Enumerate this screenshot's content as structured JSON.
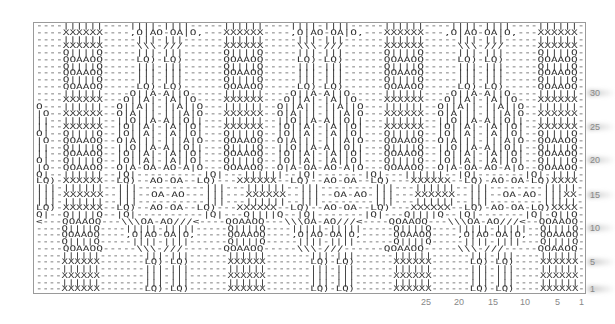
{
  "chart": {
    "columns": 84,
    "rows_count": 40,
    "grid_color": "#9a9a9a",
    "symbol_color": "#333333",
    "rows": [
      "----||||||----||||-||||-----||||||----||||-||||-----||||||----||||-||||----||||||-",
      "----XXXXXX----,O|AO-OA|O,---XXXXXX----,O|AO-OA|O,---XXXXXX---,O|AO-OA|O,---XXXXXX-",
      "----||||||-----|||-|||------||||||-----|||-|||------||||||-----|||-|||-----||||||-",
      "----XXXXXX-----\\\\\\-///------XXXXXX-----\\\\\\-///------XXXXXX-----\\\\\\-///-----XXXXXX-",
      "----Q||||Q-----|||-|||------Q||||Q-----|||-|||------Q||||Q-----|||-|||-----Q||||Q-",
      "----QOAAOQ-----LQ)-LQ)------QOAAOQ-----LQ)-LQ)------QOAAOQ-----LQ)-LQ)-----QOAAOQ-",
      "----Q||||Q-----|||-|||------Q||||Q-----|||-|||------Q||||Q-----|||-|||-----Q||||Q-",
      "----QOAAOQ-----|||-|||------QOAAOQ-----|||-|||------QOAAOQ-----|||-|||-----QOAAOQ-",
      "----Q||||Q-----|||-|||------Q||||Q-----|||-|||------Q||||Q-----|||-|||-----Q||||Q-",
      "----QOAAOQ-----LQ)-LQ)------QOAAOQ-----LQ)-LQ)------QOAAOQ-----LQ)-LQ)-----QOAAOQ-",
      "----||||||----O||A-A||O-----||||||----O||A-A||O-----||||||----O||A-A||O----||||||-",
      "----XXXXXX---O||A|-|A||O----XXXXXX---O||A|-|A||O----XXXXXX---O||A|-|A||O---XXXXXX-",
      "O---||||||--O||A||-||A||O---||||||--O||A||-||A||O---||||||--O||A||-||A||O--||||||-",
      "|O--XXXXXX--O|A|||-|||A|O---XXXXXX--O|A|||-|||A|O---XXXXXX--O|A|||-|||A|O--XXXXXX-",
      "||--||||||--||O||A-A||O||---||||||--||O||A-A||O||---||||||--||O||A-A||O||--||||||-",
      "||--XXXXXX--|O||A|-|A||O|---XXXXXX--|O||A|-|A||O|---XXXXXX--|O||A|-|A||O|--XXXXXX-",
      "O|--Q||||Q--|O||A|-|A||O|---Q||||Q--|O||A|-|A||O|---Q||||Q--|O||A|-|A||O|--Q||||Q-",
      "|O--QOAAOQ--O|A|||-|||A|O---QOAAOQ--O|A|||-|||A|O---QOAAOQ--O|A|||-|||A|O--QOAAOQ-",
      "||--Q||||Q--||O||A-A||O||---Q||||Q--||O||A-A||O||---Q||||Q--||O||A-A||O||--Q||||Q-",
      "||--QOAAOQ--|O||A|-|A||O|---QOAAOQ--|O||A|-|A||O|---QOAAOQ--|O||A|-|A||O|--QOAAOQ-",
      "O|--Q||||Q--|O||A|-|A||O|---Q||||Q--|O||A|-|A||O|---Q||||Q--|O||A|-|A||O|--Q||||Q-",
      "|O--QOAAOQ--O|A-OA-AO-A|O---QOAAOQ--O|A-OA-AO-A|O---QOAAOQ--O|A-OA-AO-A|O--QOAAOQ-",
      "Q|--||||||--|Q|----------|Q|---||||||--|Q|-------|Q|---||||||--|Q|-------|Q|-||||-",
      "LQ)-XXXXXX--LQ)--AO-OA--LQ)---XXXXXX--LQ)--AO-OA--LQ)---XXXXXX--LQ)-AO-OA-LQ)XXXX-",
      "|||-||||||--|||----------|||---||||||--|||--------|||---||||||--|||--------|||||-",
      "|||-XXXXXX--|||--OA-AO---|||---XXXXXX--|||--OA-AO-|||---XXXXXX--|||--OA-AO-|||XX-",
      "|||-||||||--|||----------|||---||||||--|||--------|||---||||||--|||--------|||||-",
      "LQ)-XXXXXX--LQ)--AO-OA--LQ)---XXXXXX--LQ)--AO-OA--LQ)---XXXXXX--LQ)-AO-OA-LQ)XXXX-",
      "Q|--Q||||Q--|Q|----------|Q|---Q||||Q--|Q|-------|Q|---Q||||Q--|Q|-------|Q|-Q||Q-",
      "<---QOAAOQ---\\\\\\OA-AO///<----QOAAOQ---\\\\\\OA-AO///<----QOAAOQ---\\\\\\OA-AO///<--QOAAOQ-",
      "----Q||||Q----|||||-|||||-----Q||||Q----|||||-|||||-----Q||||Q----|||||-|||||--Q||||Q-",
      "----QOAAOQ----,O|AO-OA|O,-----QOAAOQ----,O|AO-OA|O,-----QOAAOQ----,O|AO-OA|O,--QOAAOQ-",
      "----Q||||Q-----||||-||||------Q||||Q-----||||-||||------Q||||Q-----||||-||||---Q||||Q-",
      "----QOAAOQ-----\\\\\\-///------QOAAOQ-----\\\\\\-///------QOAAOQ-----\\\\\\-///-----QOAAOQ-",
      "----||||||-------|||-|||------||||||-------|||-|||------||||||------|||-|||----||||||-",
      "----XXXXXX-------LQ)-LQ)------XXXXXX-------LQ)-LQ)------XXXXXX------LQ)-LQ)----XXXXXX-",
      "----||||||-------|||-|||------||||||-------|||-|||------||||||------|||-|||----||||||-",
      "----XXXXXX-------|||-|||------XXXXXX-------|||-|||------XXXXXX------|||-|||----XXXXXX-",
      "----||||||-------|||-|||------||||||-------|||-|||------||||||------|||-|||----||||||-",
      "----XXXXXX-------LQ)-LQ)------XXXXXX-------LQ)-LQ)------XXXXXX------LQ)-LQ)----XXXXXX-"
    ]
  },
  "axis": {
    "column_labels": [
      {
        "text": "25",
        "x": 421
      },
      {
        "text": "20",
        "x": 454
      },
      {
        "text": "15",
        "x": 488
      },
      {
        "text": "10",
        "x": 520
      },
      {
        "text": "5",
        "x": 555
      },
      {
        "text": "1",
        "x": 579
      }
    ],
    "row_labels": [
      {
        "text": "30",
        "y": 88
      },
      {
        "text": "25",
        "y": 122
      },
      {
        "text": "20",
        "y": 155
      },
      {
        "text": "15",
        "y": 190
      },
      {
        "text": "10",
        "y": 223
      },
      {
        "text": "5",
        "y": 257
      },
      {
        "text": "1",
        "y": 284
      }
    ]
  }
}
